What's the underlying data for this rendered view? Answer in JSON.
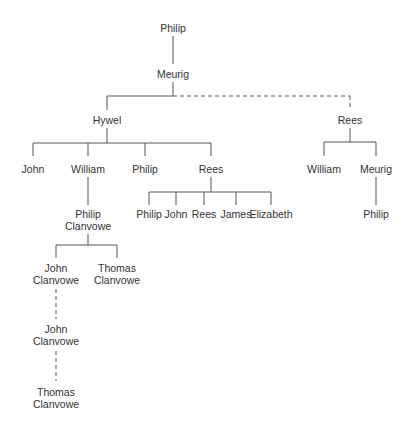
{
  "diagram": {
    "type": "family-tree",
    "line_color": "#555555",
    "text_color": "#333333",
    "nodes": {
      "philip_root": {
        "lines": [
          "Philip"
        ]
      },
      "meurig": {
        "lines": [
          "Meurig"
        ]
      },
      "hywel": {
        "lines": [
          "Hywel"
        ]
      },
      "rees_right": {
        "lines": [
          "Rees"
        ]
      },
      "john": {
        "lines": [
          "John"
        ]
      },
      "william": {
        "lines": [
          "William"
        ]
      },
      "philip": {
        "lines": [
          "Philip"
        ]
      },
      "rees": {
        "lines": [
          "Rees"
        ]
      },
      "william_right": {
        "lines": [
          "William"
        ]
      },
      "meurig_right": {
        "lines": [
          "Meurig"
        ]
      },
      "philip_right": {
        "lines": [
          "Philip"
        ]
      },
      "rees_child_philip": {
        "lines": [
          "Philip"
        ]
      },
      "rees_child_john": {
        "lines": [
          "John"
        ]
      },
      "rees_child_rees": {
        "lines": [
          "Rees"
        ]
      },
      "rees_child_james": {
        "lines": [
          "James"
        ]
      },
      "rees_child_elizabeth": {
        "lines": [
          "Elizabeth"
        ]
      },
      "philip_clanvowe": {
        "lines": [
          "Philip",
          "Clanvowe"
        ]
      },
      "john_clanvowe_1": {
        "lines": [
          "John",
          "Clanvowe"
        ]
      },
      "thomas_clanvowe_1": {
        "lines": [
          "Thomas",
          "Clanvowe"
        ]
      },
      "john_clanvowe_2": {
        "lines": [
          "John",
          "Clanvowe"
        ]
      },
      "thomas_clanvowe_2": {
        "lines": [
          "Thomas",
          "Clanvowe"
        ]
      }
    },
    "edges": [
      {
        "from": "Philip",
        "to": "Meurig",
        "style": "solid"
      },
      {
        "from": "Meurig",
        "to": "Hywel",
        "style": "solid"
      },
      {
        "from": "Meurig",
        "to": "Rees",
        "style": "dashed"
      },
      {
        "from": "Hywel",
        "to": [
          "John",
          "William",
          "Philip",
          "Rees"
        ],
        "style": "solid"
      },
      {
        "from": "Rees",
        "to": [
          "William",
          "Meurig"
        ],
        "style": "solid"
      },
      {
        "from": "Meurig",
        "to": "Philip",
        "style": "solid"
      },
      {
        "from": "Rees",
        "to": [
          "Philip",
          "John",
          "Rees",
          "James",
          "Elizabeth"
        ],
        "style": "solid"
      },
      {
        "from": "William",
        "to": "Philip Clanvowe",
        "style": "solid"
      },
      {
        "from": "Philip Clanvowe",
        "to": [
          "John Clanvowe",
          "Thomas Clanvowe"
        ],
        "style": "solid"
      },
      {
        "from": "John Clanvowe",
        "to": "John Clanvowe",
        "style": "dashed"
      },
      {
        "from": "John Clanvowe",
        "to": "Thomas Clanvowe",
        "style": "dashed"
      }
    ]
  }
}
